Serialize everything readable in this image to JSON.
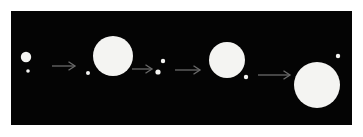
{
  "figure": {
    "background_color": "#ffffff",
    "panel": {
      "background_color": "#040404",
      "x": 11,
      "y": 11,
      "width": 341,
      "height": 114,
      "body_color": "#f4f4f2",
      "arrow_color": "#6a6a6a"
    }
  },
  "chart_data": {
    "type": "scatter",
    "title": "",
    "subtitle": "",
    "xlabel": "",
    "ylabel": "",
    "grid": false,
    "legend": null,
    "annotations": [],
    "panel_coordinate_space": {
      "width": 341,
      "height": 114
    },
    "xlim": [
      0,
      341
    ],
    "ylim": [
      0,
      114
    ],
    "stages": [
      {
        "index": 1,
        "label": "stage-1",
        "bodies": [
          {
            "name": "primary",
            "cx": 15,
            "cy": 46,
            "r": 5.2,
            "color": "#f4f4f2"
          },
          {
            "name": "companion",
            "cx": 17,
            "cy": 60,
            "r": 1.8,
            "color": "#f4f4f2"
          }
        ]
      },
      {
        "index": 2,
        "label": "stage-2",
        "bodies": [
          {
            "name": "companion",
            "cx": 77,
            "cy": 62,
            "r": 2.0,
            "color": "#f4f4f2"
          },
          {
            "name": "primary",
            "cx": 102,
            "cy": 45,
            "r": 20.0,
            "color": "#f4f4f2"
          }
        ]
      },
      {
        "index": 3,
        "label": "stage-3",
        "bodies": [
          {
            "name": "primary",
            "cx": 152,
            "cy": 50,
            "r": 2.2,
            "color": "#f4f4f2"
          },
          {
            "name": "companion",
            "cx": 147,
            "cy": 61,
            "r": 2.6,
            "color": "#f4f4f2"
          }
        ]
      },
      {
        "index": 4,
        "label": "stage-4",
        "bodies": [
          {
            "name": "primary",
            "cx": 216,
            "cy": 49,
            "r": 18.0,
            "color": "#f4f4f2"
          },
          {
            "name": "companion",
            "cx": 235,
            "cy": 66,
            "r": 2.2,
            "color": "#f4f4f2"
          }
        ]
      },
      {
        "index": 5,
        "label": "stage-5",
        "bodies": [
          {
            "name": "companion",
            "cx": 327,
            "cy": 45,
            "r": 2.2,
            "color": "#f4f4f2"
          },
          {
            "name": "primary",
            "cx": 306,
            "cy": 74,
            "r": 23.0,
            "color": "#f4f4f2"
          }
        ]
      }
    ],
    "arrows": [
      {
        "index": 1,
        "label": "arrow-1-to-2",
        "x1": 41,
        "y1": 55,
        "x2": 64,
        "y2": 55,
        "color": "#6a6a6a"
      },
      {
        "index": 2,
        "label": "arrow-2-to-3",
        "x1": 121,
        "y1": 58,
        "x2": 141,
        "y2": 58,
        "color": "#6a6a6a"
      },
      {
        "index": 3,
        "label": "arrow-3-to-4",
        "x1": 164,
        "y1": 59,
        "x2": 189,
        "y2": 59,
        "color": "#6a6a6a"
      },
      {
        "index": 4,
        "label": "arrow-4-to-5",
        "x1": 247,
        "y1": 64,
        "x2": 279,
        "y2": 64,
        "color": "#6a6a6a"
      }
    ]
  }
}
